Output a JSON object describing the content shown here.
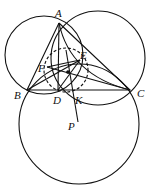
{
  "diagram": {
    "type": "geometry",
    "points": [
      {
        "name": "A",
        "x": 59,
        "y": 23,
        "lx": 55,
        "ly": 8
      },
      {
        "name": "B",
        "x": 27,
        "y": 90,
        "lx": 14,
        "ly": 90
      },
      {
        "name": "C",
        "x": 130,
        "y": 90,
        "lx": 137,
        "ly": 88
      },
      {
        "name": "D",
        "x": 58,
        "y": 90,
        "lx": 53,
        "ly": 95
      },
      {
        "name": "K",
        "x": 76,
        "y": 90,
        "lx": 75,
        "ly": 95
      },
      {
        "name": "E",
        "x": 80,
        "y": 60,
        "lx": 80,
        "ly": 50
      },
      {
        "name": "F",
        "x": 47,
        "y": 67,
        "lx": 38,
        "ly": 63
      },
      {
        "name": "P",
        "x": 78,
        "y": 122,
        "lx": 68,
        "ly": 121
      }
    ]
  }
}
